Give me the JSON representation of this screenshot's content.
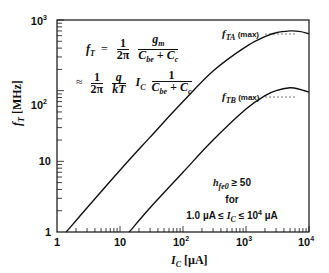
{
  "chart_data": {
    "type": "line",
    "title": "",
    "xlabel": "I_C [µA]",
    "ylabel": "f_T [MHz]",
    "xscale": "log",
    "yscale": "log",
    "xlim": [
      1,
      10000
    ],
    "ylim": [
      1,
      1000
    ],
    "grid": false,
    "legend": "none (curves labeled inline)",
    "x_tick_labels": [
      "1",
      "10",
      "10^2",
      "10^3",
      "10^4"
    ],
    "y_tick_labels": [
      "1",
      "10",
      "10^2",
      "10^3"
    ],
    "series": [
      {
        "name": "f_TA",
        "label": "f_TA (max)",
        "x": [
          1.4,
          3,
          10,
          30,
          100,
          300,
          1000,
          2000,
          3000,
          5000,
          7000,
          10000
        ],
        "y": [
          1,
          2.2,
          7.5,
          22,
          70,
          190,
          420,
          580,
          660,
          700,
          690,
          640
        ],
        "max_value": 700
      },
      {
        "name": "f_TB",
        "label": "f_TB (max)",
        "x": [
          14,
          30,
          100,
          300,
          1000,
          2000,
          3000,
          5000,
          7000,
          10000
        ],
        "y": [
          1,
          2.2,
          7,
          20,
          55,
          85,
          100,
          110,
          105,
          95
        ],
        "max_value": 110
      }
    ],
    "annotations": [
      "f_T = (1/2π) · g_m / (C_be + C_c)",
      "≈ (1/2π) · (q/kT) · I_C · 1/(C_be + C_c)",
      "h_fe0 ≥ 50",
      "for",
      "1.0 µA ≤ I_C ≤ 10^4 µA"
    ]
  },
  "axes": {
    "x": {
      "label_main": "I",
      "label_sub": "C",
      "label_unit": " [µA]",
      "ticks": [
        {
          "base": "1",
          "exp": ""
        },
        {
          "base": "10",
          "exp": ""
        },
        {
          "base": "10",
          "exp": "2"
        },
        {
          "base": "10",
          "exp": "3"
        },
        {
          "base": "10",
          "exp": "4"
        }
      ]
    },
    "y": {
      "label_main": "f",
      "label_sub": "T",
      "label_unit": " [MHz]",
      "ticks": [
        {
          "base": "1",
          "exp": ""
        },
        {
          "base": "10",
          "exp": ""
        },
        {
          "base": "10",
          "exp": "2"
        },
        {
          "base": "10",
          "exp": "3"
        }
      ]
    }
  },
  "equation": {
    "line1_lhs": "f",
    "line1_lhs_sub": "T",
    "equals": "=",
    "one": "1",
    "two_pi": "2π",
    "gm": "g",
    "gm_sub": "m",
    "cbe": "C",
    "cbe_sub": "be",
    "plus": " + ",
    "cc": "C",
    "cc_sub": "c",
    "approx": "≈",
    "q": "q",
    "kT": "kT",
    "ic": "I",
    "ic_sub": "C"
  },
  "curve_labels": {
    "a_main": "f",
    "a_sub": "TA",
    "b_main": "f",
    "b_sub": "TB",
    "max": " (max)"
  },
  "note": {
    "line1_main": "h",
    "line1_sub": "fe0",
    "line1_rest": " ≥ 50",
    "line2": "for",
    "line3_pre": "1.0 µA ≤ ",
    "line3_ic": "I",
    "line3_ic_sub": "C",
    "line3_post": " ≤ 10",
    "line3_exp": "4",
    "line3_unit": " µA"
  },
  "colors": {
    "ink": "#111111",
    "background": "#ffffff",
    "dashed": "#555555"
  }
}
